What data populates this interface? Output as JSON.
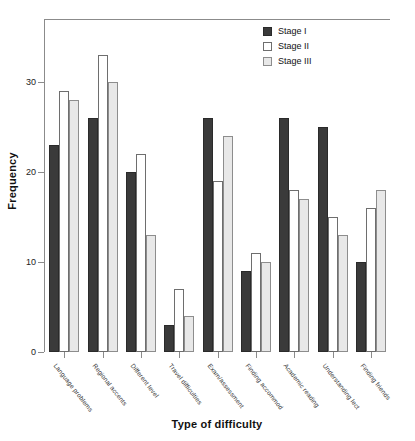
{
  "chart_data": {
    "type": "bar",
    "title": "",
    "xlabel": "Type of difficulty",
    "ylabel": "Frequency",
    "ylim": [
      0,
      35
    ],
    "yticks": [
      0,
      10,
      20,
      30
    ],
    "grid": false,
    "legend_position": "top-right",
    "categories": [
      "Language problems",
      "Regional accents",
      "Different level",
      "Travel difficulties",
      "Exam/assessment",
      "Finding accommod",
      "Academic reading",
      "Understanding lect",
      "Finding friends"
    ],
    "series": [
      {
        "name": "Stage I",
        "color": "#3a3a3a",
        "values": [
          23,
          26,
          20,
          3,
          26,
          9,
          26,
          25,
          10
        ]
      },
      {
        "name": "Stage II",
        "color": "#ffffff",
        "values": [
          29,
          33,
          22,
          7,
          19,
          11,
          18,
          15,
          16
        ]
      },
      {
        "name": "Stage III",
        "color": "#e8e8e8",
        "values": [
          28,
          30,
          13,
          4,
          24,
          10,
          17,
          13,
          18
        ]
      }
    ]
  },
  "axis": {
    "y_title": "Frequency",
    "x_title": "Type of difficulty",
    "y_tick_labels": [
      "0",
      "10",
      "20",
      "30"
    ]
  },
  "legend": {
    "entries": [
      {
        "label": "Stage I"
      },
      {
        "label": "Stage II"
      },
      {
        "label": "Stage III"
      }
    ]
  }
}
